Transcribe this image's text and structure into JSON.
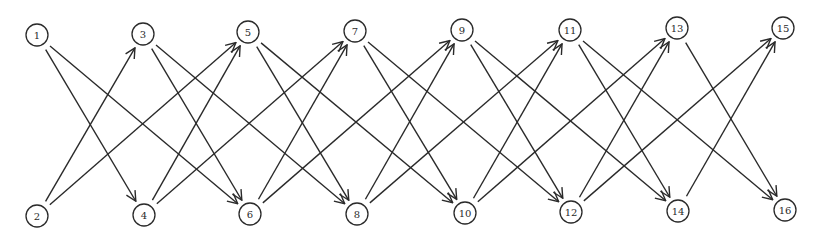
{
  "diagram": {
    "type": "directed-graph",
    "node_radius": 11,
    "stroke_color": "#2a2a2a",
    "nodes": [
      {
        "id": "1",
        "label": "1",
        "x": 37,
        "y": 35
      },
      {
        "id": "2",
        "label": "2",
        "x": 37,
        "y": 216
      },
      {
        "id": "3",
        "label": "3",
        "x": 143,
        "y": 34
      },
      {
        "id": "4",
        "label": "4",
        "x": 144,
        "y": 215
      },
      {
        "id": "5",
        "label": "5",
        "x": 248,
        "y": 32
      },
      {
        "id": "6",
        "label": "6",
        "x": 250,
        "y": 214
      },
      {
        "id": "7",
        "label": "7",
        "x": 355,
        "y": 31
      },
      {
        "id": "8",
        "label": "8",
        "x": 357,
        "y": 214
      },
      {
        "id": "9",
        "label": "9",
        "x": 462,
        "y": 30
      },
      {
        "id": "10",
        "label": "10",
        "x": 465,
        "y": 213
      },
      {
        "id": "11",
        "label": "11",
        "x": 570,
        "y": 30
      },
      {
        "id": "12",
        "label": "12",
        "x": 571,
        "y": 212
      },
      {
        "id": "13",
        "label": "13",
        "x": 677,
        "y": 28
      },
      {
        "id": "14",
        "label": "14",
        "x": 678,
        "y": 211
      },
      {
        "id": "15",
        "label": "15",
        "x": 783,
        "y": 28
      },
      {
        "id": "16",
        "label": "16",
        "x": 785,
        "y": 210
      }
    ],
    "edges": [
      {
        "from": "1",
        "to": "4"
      },
      {
        "from": "1",
        "to": "6"
      },
      {
        "from": "2",
        "to": "3"
      },
      {
        "from": "2",
        "to": "5"
      },
      {
        "from": "3",
        "to": "6"
      },
      {
        "from": "3",
        "to": "8"
      },
      {
        "from": "4",
        "to": "5"
      },
      {
        "from": "4",
        "to": "7"
      },
      {
        "from": "5",
        "to": "8"
      },
      {
        "from": "5",
        "to": "10"
      },
      {
        "from": "6",
        "to": "7"
      },
      {
        "from": "6",
        "to": "9"
      },
      {
        "from": "7",
        "to": "10"
      },
      {
        "from": "7",
        "to": "12"
      },
      {
        "from": "8",
        "to": "9"
      },
      {
        "from": "8",
        "to": "11"
      },
      {
        "from": "9",
        "to": "12"
      },
      {
        "from": "9",
        "to": "14"
      },
      {
        "from": "10",
        "to": "11"
      },
      {
        "from": "10",
        "to": "13"
      },
      {
        "from": "11",
        "to": "14"
      },
      {
        "from": "11",
        "to": "16"
      },
      {
        "from": "12",
        "to": "13"
      },
      {
        "from": "12",
        "to": "15"
      },
      {
        "from": "13",
        "to": "16"
      },
      {
        "from": "14",
        "to": "15"
      }
    ]
  }
}
